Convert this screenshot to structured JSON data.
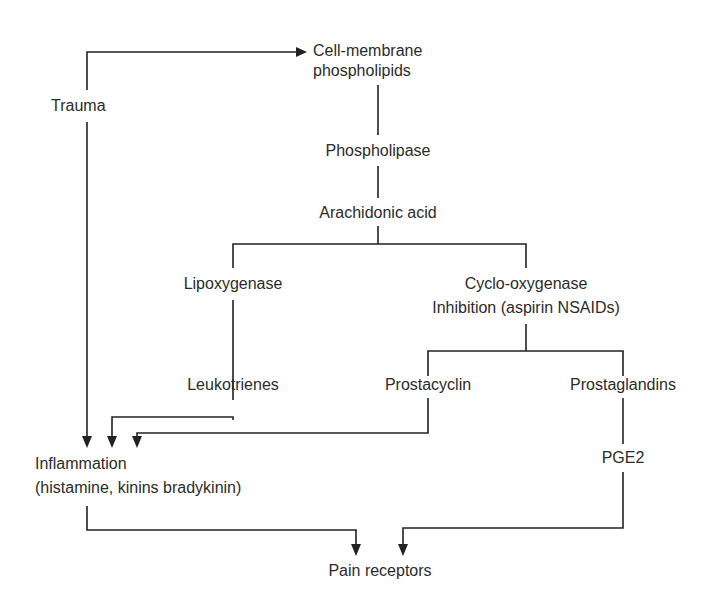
{
  "diagram": {
    "type": "flowchart",
    "colors": {
      "text": "#2b2b2b",
      "lines": "#222222",
      "background": "#ffffff"
    },
    "nodes": {
      "trauma": {
        "label": "Trauma"
      },
      "cell_membrane": {
        "line1": "Cell-membrane",
        "line2": "phospholipids"
      },
      "phospholipase": {
        "label": "Phospholipase"
      },
      "arachidonic_acid": {
        "label": "Arachidonic acid"
      },
      "lipoxygenase": {
        "label": "Lipoxygenase"
      },
      "cyclooxygenase": {
        "line1": "Cyclo-oxygenase",
        "line2": "Inhibition (aspirin NSAIDs)"
      },
      "leukotrienes": {
        "label": "Leukotrienes"
      },
      "prostacyclin": {
        "label": "Prostacyclin"
      },
      "prostaglandins": {
        "label": "Prostaglandins"
      },
      "inflammation": {
        "line1": "Inflammation",
        "line2": "(histamine, kinins bradykinin)"
      },
      "pge2": {
        "label": "PGE2"
      },
      "pain_receptors": {
        "label": "Pain receptors"
      }
    },
    "edges": [
      {
        "from": "Trauma",
        "to": "Cell-membrane phospholipids",
        "arrow": true
      },
      {
        "from": "Trauma",
        "to": "Inflammation",
        "arrow": true
      },
      {
        "from": "Cell-membrane phospholipids",
        "to": "Phospholipase",
        "arrow": false
      },
      {
        "from": "Phospholipase",
        "to": "Arachidonic acid",
        "arrow": false
      },
      {
        "from": "Arachidonic acid",
        "to": "Lipoxygenase",
        "arrow": false
      },
      {
        "from": "Arachidonic acid",
        "to": "Cyclo-oxygenase",
        "arrow": false
      },
      {
        "from": "Lipoxygenase",
        "to": "Leukotrienes",
        "arrow": false
      },
      {
        "from": "Cyclo-oxygenase",
        "to": "Prostacyclin",
        "arrow": false
      },
      {
        "from": "Cyclo-oxygenase",
        "to": "Prostaglandins",
        "arrow": false
      },
      {
        "from": "Leukotrienes",
        "to": "Inflammation",
        "arrow": true
      },
      {
        "from": "Prostacyclin",
        "to": "Inflammation",
        "arrow": true
      },
      {
        "from": "Prostaglandins",
        "to": "PGE2",
        "arrow": false
      },
      {
        "from": "Inflammation",
        "to": "Pain receptors",
        "arrow": true
      },
      {
        "from": "PGE2",
        "to": "Pain receptors",
        "arrow": true
      }
    ]
  }
}
